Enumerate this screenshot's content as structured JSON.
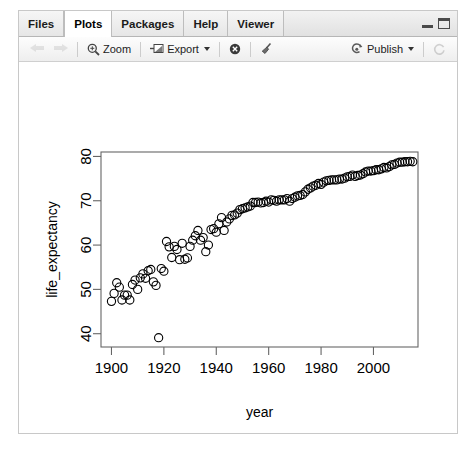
{
  "window": {
    "tabs": [
      {
        "label": "Files",
        "active": false,
        "name": "tab-files"
      },
      {
        "label": "Plots",
        "active": true,
        "name": "tab-plots"
      },
      {
        "label": "Packages",
        "active": false,
        "name": "tab-packages"
      },
      {
        "label": "Help",
        "active": false,
        "name": "tab-help"
      },
      {
        "label": "Viewer",
        "active": false,
        "name": "tab-viewer"
      }
    ],
    "controls": {
      "minimize_icon": "minimize-icon",
      "maximize_icon": "maximize-icon"
    }
  },
  "toolbar": {
    "back_icon": "back-arrow-icon",
    "forward_icon": "forward-arrow-icon",
    "zoom_label": "Zoom",
    "zoom_icon": "magnifier-icon",
    "export_label": "Export",
    "export_icon": "export-icon",
    "export_caret": "chevron-down-icon",
    "remove_icon": "remove-plot-icon",
    "clear_icon": "broom-clear-icon",
    "publish_label": "Publish",
    "publish_icon": "publish-icon",
    "publish_caret": "chevron-down-icon",
    "refresh_icon": "refresh-icon"
  },
  "chart_data": {
    "type": "scatter",
    "title": "",
    "xlabel": "year",
    "ylabel": "life_expectancy",
    "xlim": [
      1896,
      2017
    ],
    "ylim": [
      37,
      81
    ],
    "xticks": [
      1900,
      1920,
      1940,
      1960,
      1980,
      2000
    ],
    "yticks": [
      40,
      50,
      60,
      70,
      80
    ],
    "grid": false,
    "legend": null,
    "point_symbol": "open-circle",
    "point_color": "#000000",
    "x": [
      1900,
      1901,
      1902,
      1903,
      1904,
      1905,
      1906,
      1907,
      1908,
      1909,
      1910,
      1911,
      1912,
      1913,
      1914,
      1915,
      1916,
      1917,
      1918,
      1919,
      1920,
      1921,
      1922,
      1923,
      1924,
      1925,
      1926,
      1927,
      1928,
      1929,
      1930,
      1931,
      1932,
      1933,
      1934,
      1935,
      1936,
      1937,
      1938,
      1939,
      1940,
      1941,
      1942,
      1943,
      1944,
      1945,
      1946,
      1947,
      1948,
      1949,
      1950,
      1951,
      1952,
      1953,
      1954,
      1955,
      1956,
      1957,
      1958,
      1959,
      1960,
      1961,
      1962,
      1963,
      1964,
      1965,
      1966,
      1967,
      1968,
      1969,
      1970,
      1971,
      1972,
      1973,
      1974,
      1975,
      1976,
      1977,
      1978,
      1979,
      1980,
      1981,
      1982,
      1983,
      1984,
      1985,
      1986,
      1987,
      1988,
      1989,
      1990,
      1991,
      1992,
      1993,
      1994,
      1995,
      1996,
      1997,
      1998,
      1999,
      2000,
      2001,
      2002,
      2003,
      2004,
      2005,
      2006,
      2007,
      2008,
      2009,
      2010,
      2011,
      2012,
      2013,
      2014,
      2015
    ],
    "y": [
      47.3,
      49.1,
      51.5,
      50.5,
      47.6,
      48.7,
      48.7,
      47.6,
      51.1,
      52.1,
      50.0,
      52.6,
      53.5,
      52.5,
      54.2,
      54.5,
      51.7,
      50.9,
      39.1,
      54.7,
      54.1,
      60.8,
      59.6,
      57.2,
      59.7,
      59.0,
      56.7,
      60.4,
      56.8,
      57.1,
      59.7,
      61.1,
      62.1,
      63.3,
      61.1,
      61.7,
      58.5,
      60.0,
      63.5,
      63.7,
      62.9,
      64.8,
      66.2,
      63.3,
      65.2,
      65.9,
      66.7,
      66.8,
      67.2,
      68.0,
      68.2,
      68.4,
      68.6,
      68.8,
      69.6,
      69.6,
      69.7,
      69.5,
      69.6,
      69.9,
      69.7,
      70.2,
      70.1,
      69.9,
      70.2,
      70.2,
      70.2,
      70.5,
      69.9,
      70.5,
      70.8,
      71.1,
      71.2,
      71.4,
      72.0,
      72.6,
      72.9,
      73.3,
      73.5,
      73.9,
      73.7,
      74.2,
      74.5,
      74.6,
      74.7,
      74.7,
      74.7,
      74.9,
      74.9,
      75.1,
      75.4,
      75.5,
      75.8,
      75.5,
      75.7,
      75.8,
      76.1,
      76.5,
      76.7,
      76.7,
      76.8,
      77.0,
      77.0,
      77.2,
      77.5,
      77.4,
      77.7,
      78.1,
      78.2,
      78.5,
      78.7,
      78.7,
      78.8,
      78.8,
      78.9,
      78.8
    ],
    "annotations": [
      {
        "text": "",
        "x": 1918,
        "y": 39.1,
        "note": "outlier low point"
      }
    ],
    "n_points": 116
  }
}
